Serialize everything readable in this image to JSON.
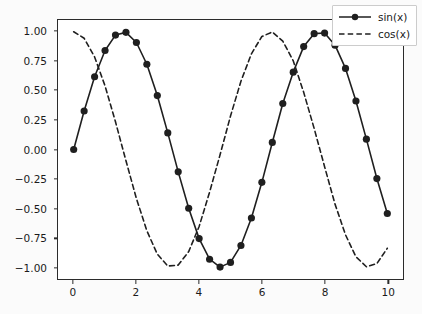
{
  "chart_data": {
    "type": "line",
    "title": "",
    "xlabel": "",
    "ylabel": "",
    "xlim": [
      -0.5,
      10.5
    ],
    "ylim": [
      -1.1,
      1.1
    ],
    "grid": false,
    "legend_position": "upper right",
    "xticks": [
      0,
      2,
      4,
      6,
      8,
      10
    ],
    "xtick_labels": [
      "0",
      "2",
      "4",
      "6",
      "8",
      "10"
    ],
    "yticks": [
      1.0,
      0.75,
      0.5,
      0.25,
      0.0,
      -0.25,
      -0.5,
      -0.75,
      -1.0
    ],
    "ytick_labels": [
      "1.00",
      "0.75",
      "0.50",
      "0.25",
      "0.00",
      "−0.25",
      "−0.50",
      "−0.75",
      "−1.00"
    ],
    "x": [
      0.0,
      0.333,
      0.667,
      1.0,
      1.333,
      1.667,
      2.0,
      2.333,
      2.667,
      3.0,
      3.333,
      3.667,
      4.0,
      4.333,
      4.667,
      5.0,
      5.333,
      5.667,
      6.0,
      6.333,
      6.667,
      7.0,
      7.333,
      7.667,
      8.0,
      8.333,
      8.667,
      9.0,
      9.333,
      9.667,
      10.0
    ],
    "series": [
      {
        "name": "sin(x)",
        "label": "sin(x)",
        "color": "#1f1f1f",
        "linestyle": "solid",
        "marker": "circle",
        "values": [
          0.0,
          0.327,
          0.618,
          0.841,
          0.972,
          0.995,
          0.909,
          0.724,
          0.458,
          0.141,
          -0.19,
          -0.499,
          -0.757,
          -0.932,
          -0.999,
          -0.959,
          -0.815,
          -0.582,
          -0.279,
          0.06,
          0.391,
          0.657,
          0.874,
          0.984,
          0.989,
          0.886,
          0.689,
          0.412,
          0.088,
          -0.247,
          -0.544
        ]
      },
      {
        "name": "cos(x)",
        "label": "cos(x)",
        "color": "#1f1f1f",
        "linestyle": "dashed",
        "marker": "none",
        "values": [
          1.0,
          0.945,
          0.786,
          0.54,
          0.235,
          -0.096,
          -0.416,
          -0.69,
          -0.889,
          -0.99,
          -0.982,
          -0.867,
          -0.654,
          -0.362,
          -0.045,
          0.284,
          0.58,
          0.813,
          0.96,
          0.998,
          0.921,
          0.754,
          0.486,
          0.179,
          -0.146,
          -0.464,
          -0.725,
          -0.911,
          -0.996,
          -0.969,
          -0.839
        ]
      }
    ]
  },
  "legend": {
    "entries": [
      {
        "label": "sin(x)"
      },
      {
        "label": "cos(x)"
      }
    ]
  }
}
